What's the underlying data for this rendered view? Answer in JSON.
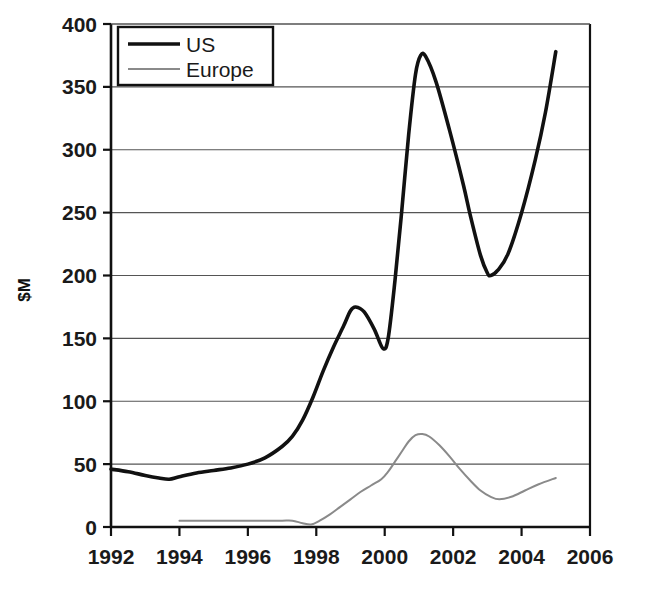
{
  "chart_data": {
    "type": "line",
    "title": "",
    "xlabel": "",
    "ylabel": "$M",
    "xlim": [
      1992,
      2006
    ],
    "ylim": [
      0,
      400
    ],
    "xticks": [
      1992,
      1994,
      1996,
      1998,
      2000,
      2002,
      2004,
      2006
    ],
    "xtick_labels": [
      "1992",
      "1994",
      "1996",
      "1998",
      "2000",
      "2002",
      "2004",
      "2006"
    ],
    "yticks": [
      0,
      50,
      100,
      150,
      200,
      250,
      300,
      350,
      400
    ],
    "ytick_labels": [
      "0",
      "50",
      "100",
      "150",
      "200",
      "250",
      "300",
      "350",
      "400"
    ],
    "grid": "horizontal",
    "legend_position": "top-left",
    "series": [
      {
        "name": "US",
        "color": "#111111",
        "width": 3.6,
        "points": [
          [
            1992.0,
            46
          ],
          [
            1992.5,
            44
          ],
          [
            1993.0,
            41
          ],
          [
            1993.4,
            39
          ],
          [
            1993.7,
            38
          ],
          [
            1994.0,
            40
          ],
          [
            1994.5,
            43
          ],
          [
            1995.0,
            45
          ],
          [
            1995.5,
            47
          ],
          [
            1996.0,
            50
          ],
          [
            1996.5,
            55
          ],
          [
            1997.0,
            64
          ],
          [
            1997.3,
            72
          ],
          [
            1997.6,
            85
          ],
          [
            1997.9,
            103
          ],
          [
            1998.2,
            124
          ],
          [
            1998.5,
            143
          ],
          [
            1998.8,
            160
          ],
          [
            1999.0,
            172
          ],
          [
            1999.15,
            175
          ],
          [
            1999.4,
            171
          ],
          [
            1999.7,
            157
          ],
          [
            1999.95,
            142
          ],
          [
            2000.1,
            150
          ],
          [
            2000.3,
            196
          ],
          [
            2000.5,
            252
          ],
          [
            2000.7,
            312
          ],
          [
            2000.9,
            360
          ],
          [
            2001.05,
            375
          ],
          [
            2001.2,
            374
          ],
          [
            2001.5,
            354
          ],
          [
            2001.9,
            315
          ],
          [
            2002.3,
            272
          ],
          [
            2002.5,
            248
          ],
          [
            2002.8,
            216
          ],
          [
            2003.0,
            202
          ],
          [
            2003.1,
            200
          ],
          [
            2003.3,
            204
          ],
          [
            2003.6,
            217
          ],
          [
            2004.0,
            250
          ],
          [
            2004.4,
            292
          ],
          [
            2004.7,
            330
          ],
          [
            2005.0,
            378
          ]
        ]
      },
      {
        "name": "Europe",
        "color": "#8a8a8a",
        "width": 2.0,
        "points": [
          [
            1994.0,
            5
          ],
          [
            1994.5,
            5
          ],
          [
            1995.0,
            5
          ],
          [
            1995.5,
            5
          ],
          [
            1996.0,
            5
          ],
          [
            1996.5,
            5
          ],
          [
            1997.0,
            5
          ],
          [
            1997.3,
            5
          ],
          [
            1997.6,
            3
          ],
          [
            1997.85,
            2
          ],
          [
            1998.1,
            5
          ],
          [
            1998.4,
            10
          ],
          [
            1998.7,
            16
          ],
          [
            1999.0,
            22
          ],
          [
            1999.3,
            28
          ],
          [
            1999.6,
            33
          ],
          [
            1999.9,
            38
          ],
          [
            2000.1,
            44
          ],
          [
            2000.3,
            52
          ],
          [
            2000.5,
            60
          ],
          [
            2000.7,
            68
          ],
          [
            2000.9,
            73
          ],
          [
            2001.1,
            74
          ],
          [
            2001.3,
            72
          ],
          [
            2001.6,
            65
          ],
          [
            2001.9,
            56
          ],
          [
            2002.2,
            46
          ],
          [
            2002.5,
            37
          ],
          [
            2002.8,
            29
          ],
          [
            2003.1,
            24
          ],
          [
            2003.35,
            22
          ],
          [
            2003.7,
            24
          ],
          [
            2004.1,
            29
          ],
          [
            2004.5,
            34
          ],
          [
            2005.0,
            39
          ]
        ]
      }
    ]
  },
  "legend": {
    "entries": [
      {
        "label": "US"
      },
      {
        "label": "Europe"
      }
    ]
  },
  "axes": {
    "y_axis_title": "$M"
  }
}
